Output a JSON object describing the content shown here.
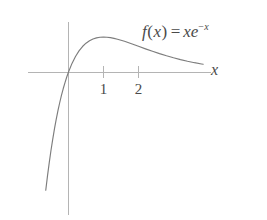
{
  "figure": {
    "background_color": "#ffffff",
    "width": 267,
    "height": 220
  },
  "chart_data": {
    "type": "line",
    "title": "",
    "subtitle": "",
    "xlabel": "x",
    "ylabel": "",
    "function_expression": "f(x) = xe^{-x}",
    "annotations": [
      {
        "name": "function-label",
        "text": "f(x) = xe^{-x}",
        "x": 2.1,
        "y": 0.5
      }
    ],
    "grid": false,
    "legend": false,
    "legend_position": "none",
    "axis_color": "#b4b4b4",
    "curve_color": "#7d7d7d",
    "text_color": "#4a4a4a",
    "xlim": [
      -0.65,
      4.05
    ],
    "ylim": [
      -1.5,
      0.52
    ],
    "xticks": [
      1,
      2
    ],
    "xtick_labels": [
      "1",
      "2"
    ],
    "yticks": [],
    "ytick_labels": [],
    "series": [
      {
        "name": "f(x) = xe^{-x}",
        "color": "#7d7d7d",
        "x": [
          -0.65,
          -0.6,
          -0.55,
          -0.5,
          -0.45,
          -0.4,
          -0.35,
          -0.3,
          -0.25,
          -0.2,
          -0.15,
          -0.1,
          -0.05,
          0.0,
          0.1,
          0.2,
          0.3,
          0.4,
          0.5,
          0.6,
          0.7,
          0.8,
          0.9,
          1.0,
          1.1,
          1.2,
          1.3,
          1.4,
          1.5,
          1.6,
          1.7,
          1.8,
          1.9,
          2.0,
          2.2,
          2.4,
          2.6,
          2.8,
          3.0,
          3.2,
          3.4,
          3.6,
          3.8,
          3.85
        ],
        "y": [
          -1.245,
          -1.093,
          -0.954,
          -0.824,
          -0.706,
          -0.597,
          -0.497,
          -0.405,
          -0.321,
          -0.244,
          -0.174,
          -0.111,
          -0.053,
          0.0,
          0.0905,
          0.1637,
          0.2222,
          0.2681,
          0.3033,
          0.3293,
          0.3476,
          0.3595,
          0.3659,
          0.3679,
          0.3662,
          0.3614,
          0.3543,
          0.3452,
          0.3347,
          0.323,
          0.3106,
          0.2975,
          0.2842,
          0.2707,
          0.2438,
          0.2177,
          0.1931,
          0.1703,
          0.1494,
          0.1304,
          0.1133,
          0.098,
          0.0846,
          0.0815
        ]
      }
    ],
    "x_axis_line": {
      "x_from": -1.15,
      "x_to": 4.06,
      "y": 0.0
    },
    "y_axis_line": {
      "y_from": 0.525,
      "y_to": -1.505,
      "x": 0.0
    }
  },
  "labels": {
    "function_label": {
      "f": "f",
      "open_paren": "(",
      "arg": "x",
      "close_paren": ")",
      "equals": "=",
      "x_factor": "x",
      "e_base": "e",
      "exp_minus": "−",
      "exp_var": "x"
    },
    "axis_x": "x",
    "tick_1": "1",
    "tick_2": "2"
  }
}
